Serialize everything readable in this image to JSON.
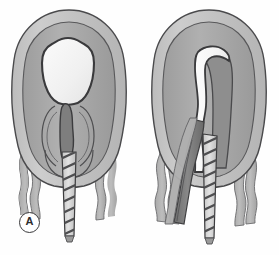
{
  "figure": {
    "background_color": "#fefefe",
    "width": 279,
    "height": 255,
    "panel_count": 2
  },
  "panels": [
    {
      "id": "A",
      "label": "A",
      "label_style": "circled-letter",
      "description": "Uterus cross-section with intact rounded amniotic sac and descending twisted umbilical cord",
      "parts": [
        {
          "name": "uterine-outer-wall",
          "color": "#c9c9c9"
        },
        {
          "name": "uterine-inner-wall",
          "color": "#a8a8a8"
        },
        {
          "name": "amniotic-sac",
          "color": "#f4f4f4"
        },
        {
          "name": "cervical-canal",
          "color": "#8b8b8b"
        },
        {
          "name": "umbilical-cord",
          "color": "#d8d8d8"
        },
        {
          "name": "membrane-strand-left",
          "color": "#b5b5b5"
        },
        {
          "name": "membrane-strand-right",
          "color": "#b5b5b5"
        }
      ]
    },
    {
      "id": "B",
      "label": "B",
      "label_style": "circled-letter",
      "description": "Uterus cross-section with elongated inverted fundus, exposed white cleft and prolapsed twisted umbilical cord",
      "parts": [
        {
          "name": "uterine-outer-wall",
          "color": "#c9c9c9"
        },
        {
          "name": "uterine-inner-wall",
          "color": "#a8a8a8"
        },
        {
          "name": "inverted-cleft",
          "color": "#f7f7f7"
        },
        {
          "name": "prolapsed-mass",
          "color": "#7e7e7e"
        },
        {
          "name": "umbilical-cord",
          "color": "#d8d8d8"
        },
        {
          "name": "membrane-strand-left",
          "color": "#b5b5b5"
        },
        {
          "name": "membrane-strand-right",
          "color": "#b5b5b5"
        }
      ]
    }
  ],
  "colors": {
    "outline": "#3a3a3c",
    "outline_soft": "#6b6b6d",
    "outer_wall": "#c9c9c9",
    "inner_wall": "#a8a8a8",
    "sac_fill": "#f4f4f4",
    "dark_tissue": "#7e7e7e",
    "mid_tissue": "#9a9a9a",
    "cord_fill": "#dadada",
    "cord_stripe": "#4e4e50",
    "membrane": "#b5b5b5",
    "label_text": "#2c2c2e",
    "background": "#fefefe"
  }
}
